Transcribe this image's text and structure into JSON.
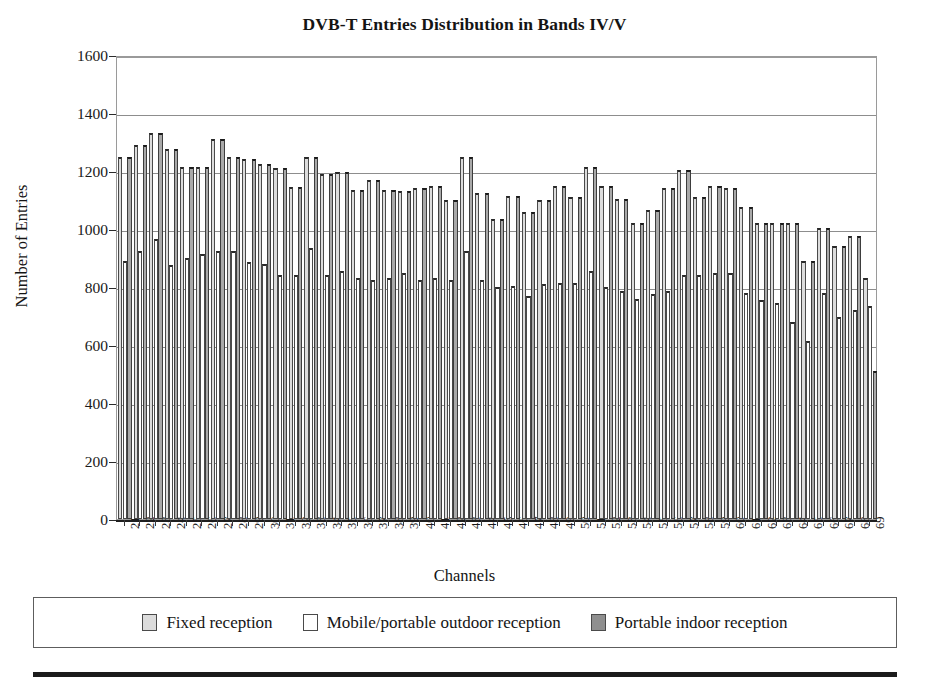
{
  "chart_data": {
    "type": "bar",
    "title": "DVB-T Entries Distribution in Bands IV/V",
    "xlabel": "Channels",
    "ylabel": "Number of Entries",
    "ylim": [
      0,
      1600
    ],
    "ytick_step": 200,
    "yticks": [
      0,
      200,
      400,
      600,
      800,
      1000,
      1200,
      1400,
      1600
    ],
    "ytick_labels": [
      "0",
      "200",
      "400",
      "600",
      "800",
      "1000",
      "1200",
      "1400",
      "1600"
    ],
    "grid": true,
    "legend_position": "bottom",
    "categories": [
      "21",
      "22",
      "23",
      "24",
      "25",
      "26",
      "27",
      "28",
      "29",
      "30",
      "31",
      "32",
      "33",
      "34",
      "35",
      "36",
      "37",
      "38",
      "39",
      "40",
      "41",
      "42",
      "43",
      "44",
      "45",
      "46",
      "47",
      "48",
      "49",
      "50",
      "51",
      "52",
      "53",
      "54",
      "55",
      "56",
      "57",
      "58",
      "59",
      "60",
      "61",
      "62",
      "63",
      "64",
      "65",
      "66",
      "67",
      "68",
      "69"
    ],
    "series": [
      {
        "name": "Fixed reception",
        "color": "#dcdcdc",
        "values": [
          1250,
          1290,
          1330,
          1275,
          1215,
          1215,
          1310,
          1250,
          1240,
          1225,
          1210,
          1145,
          1250,
          1190,
          1195,
          1135,
          1170,
          1135,
          1130,
          1140,
          1150,
          1100,
          1250,
          1125,
          1035,
          1115,
          1060,
          1100,
          1150,
          1110,
          1215,
          1150,
          1105,
          1020,
          1065,
          1140,
          1205,
          1110,
          1150,
          1140,
          1075,
          1020,
          1020,
          1020,
          890,
          1005,
          940,
          975,
          830
        ]
      },
      {
        "name": "Mobile/portable outdoor reception",
        "color": "#ffffff",
        "values": [
          890,
          925,
          965,
          875,
          900,
          915,
          925,
          925,
          885,
          880,
          840,
          840,
          935,
          840,
          855,
          830,
          825,
          830,
          850,
          825,
          830,
          825,
          925,
          825,
          800,
          805,
          770,
          810,
          815,
          815,
          855,
          800,
          785,
          760,
          775,
          785,
          840,
          840,
          850,
          850,
          780,
          755,
          745,
          680,
          615,
          780,
          695,
          720,
          735
        ]
      },
      {
        "name": "Portable indoor reception",
        "color": "#a9a9a9",
        "values": [
          1250,
          1290,
          1330,
          1275,
          1215,
          1215,
          1310,
          1250,
          1240,
          1225,
          1210,
          1145,
          1250,
          1190,
          1195,
          1135,
          1170,
          1135,
          1130,
          1140,
          1150,
          1100,
          1250,
          1125,
          1035,
          1115,
          1060,
          1100,
          1150,
          1110,
          1215,
          1150,
          1105,
          1020,
          1065,
          1140,
          1205,
          1110,
          1150,
          1140,
          1075,
          1020,
          1020,
          1020,
          890,
          1005,
          940,
          975,
          510
        ]
      }
    ]
  },
  "legend": {
    "items": [
      {
        "label": "Fixed reception",
        "swatch": "fixed"
      },
      {
        "label": "Mobile/portable outdoor reception",
        "swatch": "mobile"
      },
      {
        "label": "Portable indoor reception",
        "swatch": "indoor"
      }
    ]
  }
}
